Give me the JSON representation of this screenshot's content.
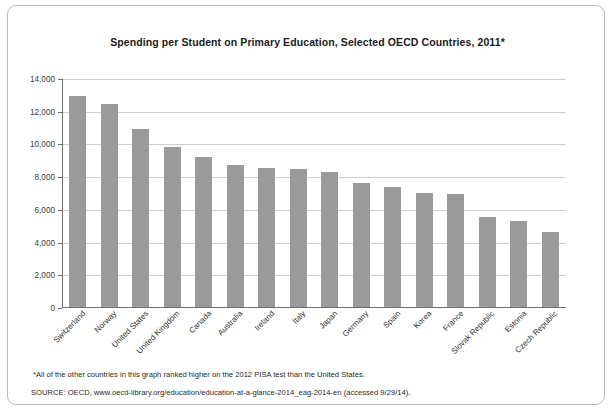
{
  "figure": {
    "title": "Spending per Student on Primary Education, Selected OECD Countries, 2011*",
    "footnote": "*All of the other countries in this graph ranked higher on the 2012 PISA test than the United States.",
    "source": "SOURCE:  OECD, www.oecd-library.org/education/education-at-a-glance-2014_eag-2014-en (accessed 9/29/14)."
  },
  "colors": {
    "bar": "#9a9a9a",
    "gridline": "#cfcfcf",
    "axis": "#6f6f6f",
    "frame_border": "#b9b9b9",
    "background": "#ffffff",
    "text": "#2a2a2a"
  },
  "chart_data": {
    "type": "bar",
    "title": "Spending per Student on Primary Education, Selected OECD Countries, 2011*",
    "xlabel": "",
    "ylabel": "",
    "ylim": [
      0,
      14000
    ],
    "ytick_labels": [
      "14,000",
      "12,000",
      "10,000",
      "8,000",
      "6,000",
      "4,000",
      "2,000",
      "0"
    ],
    "ytick_values": [
      14000,
      12000,
      10000,
      8000,
      6000,
      4000,
      2000,
      0
    ],
    "grid": true,
    "legend": "none",
    "categories": [
      "Switzerland",
      "Norway",
      "United States",
      "United Kingdom",
      "Canada",
      "Australia",
      "Ireland",
      "Italy",
      "Japan",
      "Germany",
      "Spain",
      "Korea",
      "France",
      "Slovak Republic",
      "Estonia",
      "Czech Republic"
    ],
    "values": [
      12950,
      12500,
      10950,
      9850,
      9250,
      8750,
      8550,
      8500,
      8300,
      7650,
      7400,
      7050,
      7000,
      5550,
      5350,
      4650
    ]
  }
}
